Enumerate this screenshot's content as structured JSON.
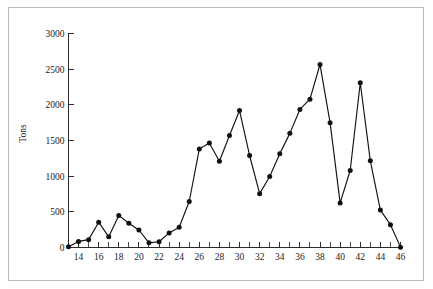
{
  "chart_data": {
    "type": "line",
    "title": "",
    "subtitle": "",
    "xlabel": "",
    "ylabel": "Tons",
    "xlim": [
      13,
      46
    ],
    "ylim": [
      0,
      3000
    ],
    "grid": false,
    "legend": null,
    "marker": "filled-circle",
    "line_color": "#121212",
    "x_tick_labels": [
      "14",
      "16",
      "18",
      "20",
      "22",
      "24",
      "26",
      "28",
      "30",
      "32",
      "34",
      "36",
      "38",
      "40",
      "42",
      "44",
      "46"
    ],
    "x_tick_values": [
      14,
      16,
      18,
      20,
      22,
      24,
      26,
      28,
      30,
      32,
      34,
      36,
      38,
      40,
      42,
      44,
      46
    ],
    "x_minor_tick_values": [
      13,
      15,
      17,
      19,
      21,
      23,
      25,
      27,
      29,
      31,
      33,
      35,
      37,
      39,
      41,
      43,
      45
    ],
    "y_tick_labels": [
      "0",
      "500",
      "1000",
      "1500",
      "2000",
      "2500",
      "3000"
    ],
    "y_tick_values": [
      0,
      500,
      1000,
      1500,
      2000,
      2500,
      3000
    ],
    "x": [
      13,
      14,
      15,
      16,
      17,
      18,
      19,
      20,
      21,
      22,
      23,
      24,
      25,
      26,
      27,
      28,
      29,
      30,
      31,
      32,
      33,
      34,
      35,
      36,
      37,
      38,
      39,
      40,
      41,
      42,
      43,
      44,
      45,
      46
    ],
    "values": [
      10,
      85,
      110,
      355,
      150,
      450,
      340,
      245,
      65,
      80,
      205,
      285,
      645,
      1380,
      1465,
      1210,
      1570,
      1920,
      1290,
      755,
      995,
      1315,
      1600,
      1935,
      2080,
      2565,
      1750,
      625,
      1080,
      2310,
      1215,
      525,
      320,
      5
    ],
    "series": [
      {
        "name": "Tons",
        "values": [
          10,
          85,
          110,
          355,
          150,
          450,
          340,
          245,
          65,
          80,
          205,
          285,
          645,
          1380,
          1465,
          1210,
          1570,
          1920,
          1290,
          755,
          995,
          1315,
          1600,
          1935,
          2080,
          2565,
          1750,
          625,
          1080,
          2310,
          1215,
          525,
          320,
          5
        ]
      }
    ]
  }
}
